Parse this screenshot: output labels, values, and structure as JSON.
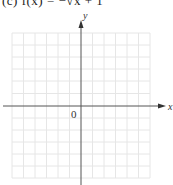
{
  "caption": {
    "text": "(c) f(x) = −√x + 1",
    "note_visible": "partially cropped at top edge"
  },
  "graph": {
    "x_axis_label": "x",
    "y_axis_label": "y",
    "origin_label": "0",
    "grid": {
      "columns": 12,
      "rows": 12,
      "left": 12,
      "right": 150,
      "top": 33,
      "bottom": 178
    },
    "colors": {
      "grid": "#e6e6e6",
      "axis": "#555555",
      "text": "#333333"
    }
  }
}
